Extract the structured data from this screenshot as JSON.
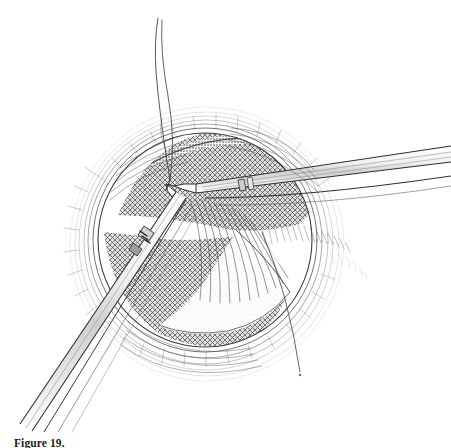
{
  "document": {
    "page_background": "#ffffff",
    "ink_color": "#2b2b2b"
  },
  "figure": {
    "caption_label": "Figure 19.",
    "caption_text": "",
    "alt_description": "Pen-and-ink medical illustration of a circular operative field showing cross-hatched tissue, two long surgical instruments converging at a suture point, and a suture thread looping upward.",
    "media": "pen-and-ink line drawing",
    "elements": [
      {
        "id": "wound-field",
        "name": "circular-operative-field",
        "shape": "circle",
        "center_x": 205,
        "center_y": 240,
        "radius": 108,
        "fill_style": "cross-hatch",
        "fill_tone": "#6d6d6d"
      },
      {
        "id": "wound-margin",
        "name": "layered-wound-margin",
        "description": "concentric layered retracted tissue edges",
        "line_count": 7
      },
      {
        "id": "instrument-right",
        "name": "right-forceps",
        "description": "long needle-holder entering from the right edge",
        "tip_x": 175,
        "tip_y": 186,
        "tail_x": 451,
        "tail_y": 152,
        "shaft_width": 9
      },
      {
        "id": "instrument-left",
        "name": "left-forceps",
        "description": "long needle-holder entering from the lower-left edge",
        "tip_x": 176,
        "tip_y": 196,
        "tail_x": 8,
        "tail_y": 430,
        "shaft_width": 8
      },
      {
        "id": "suture-loop",
        "name": "suture-thread-loop",
        "description": "suture thread rising above the field with a crossing twist",
        "top_y": 18,
        "anchor_x": 170,
        "anchor_y": 180
      },
      {
        "id": "suture-tail",
        "name": "suture-thread-tail",
        "description": "thin curved suture tail descending at the lower right",
        "end_x": 300,
        "end_y": 378
      },
      {
        "id": "tissue-flap",
        "name": "retracted-tissue-flap",
        "description": "pale tissue flap with radiating fold lines lifted toward lower right"
      },
      {
        "id": "feather-hatching",
        "name": "feathered-edge-shading",
        "description": "light feathery strokes fading to the right of the field"
      }
    ]
  }
}
